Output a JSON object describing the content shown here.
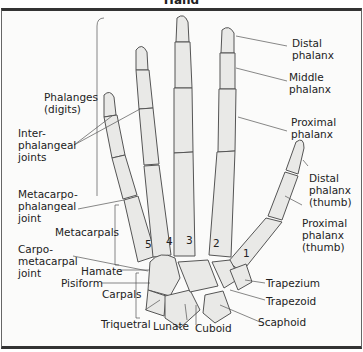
{
  "title": "Hand",
  "labels": {
    "distal_phalanx": "Distal\nphalanx",
    "middle_phalanx": "Middle\nphalanx",
    "proximal_phalanx": "Proximal\nphalanx",
    "distal_phalanx_thumb": "Distal\nphalanx\n(thumb)",
    "proximal_phalanx_thumb": "Proximal\nphalanx\n(thumb)",
    "phalanges": "Phalanges\n(digits)",
    "interphalangeal": "Inter-\nphalangeal\njoints",
    "metacarpophalangeal": "Metacarpo-\nphalangeal\njoint",
    "metacarpals": "Metacarpals",
    "carpometacarpal": "Carpo-\nmetacarpal\njoint",
    "hamate": "Hamate",
    "pisiform": "Pisiform",
    "carpals": "Carpals",
    "triquetral": "Triquetral",
    "lunate": "Lunate",
    "cuboid": "Cuboid",
    "scaphoid": "Scaphoid",
    "trapezoid": "Trapezoid",
    "trapezium": "Trapezium"
  },
  "metacarpal_numbers": [
    "5",
    "4",
    "3",
    "2",
    "1"
  ],
  "colors": {
    "bone_fill": "#e9e9e7",
    "bone_stroke": "#555555",
    "leader": "#555555",
    "frame": "#333333"
  }
}
